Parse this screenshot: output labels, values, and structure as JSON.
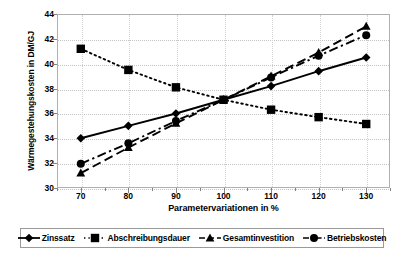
{
  "chart_data": {
    "type": "line",
    "title": "",
    "xlabel": "Parametervariationen in %",
    "ylabel": "Wärmegestehungskosten in DM/GJ",
    "x": [
      70,
      80,
      90,
      100,
      110,
      120,
      130
    ],
    "xlim": [
      65,
      135
    ],
    "ylim": [
      30,
      44
    ],
    "xticks": [
      "70",
      "80",
      "90",
      "100",
      "110",
      "120",
      "130"
    ],
    "yticks": [
      "30",
      "32",
      "34",
      "36",
      "38",
      "40",
      "42",
      "44"
    ],
    "grid": true,
    "legend_position": "bottom",
    "series": [
      {
        "name": "Zinssatz",
        "marker": "diamond",
        "line": "solid",
        "color": "#000000",
        "values": [
          34.0,
          35.0,
          36.0,
          37.1,
          38.2,
          39.4,
          40.5
        ]
      },
      {
        "name": "Abschreibungsdauer",
        "marker": "square",
        "line": "dotted",
        "color": "#000000",
        "values": [
          41.2,
          39.5,
          38.1,
          37.1,
          36.3,
          35.7,
          35.15
        ]
      },
      {
        "name": "Gesamtinvestition",
        "marker": "triangle",
        "line": "dashed",
        "color": "#000000",
        "values": [
          31.2,
          33.25,
          35.2,
          37.1,
          39.0,
          40.9,
          43.0
        ]
      },
      {
        "name": "Betriebskosten",
        "marker": "circle",
        "line": "dash-dot",
        "color": "#000000",
        "values": [
          31.95,
          33.6,
          35.4,
          37.1,
          38.9,
          40.65,
          42.3
        ]
      }
    ]
  },
  "axis": {
    "y_title": "Wärmegestehungskosten in DM/GJ",
    "x_title": "Parametervariationen in %",
    "y_tick_labels": [
      "44",
      "42",
      "40",
      "38",
      "36",
      "34",
      "32",
      "30"
    ],
    "x_tick_labels": [
      "70",
      "80",
      "90",
      "100",
      "110",
      "120",
      "130"
    ]
  },
  "legend": {
    "items": [
      {
        "label": "Zinssatz",
        "marker": "diamond",
        "line": "solid"
      },
      {
        "label": "Abschreibungsdauer",
        "marker": "square",
        "line": "dotted"
      },
      {
        "label": "Gesamtinvestition",
        "marker": "triangle",
        "line": "dashed"
      },
      {
        "label": "Betriebskosten",
        "marker": "circle",
        "line": "dash-dot"
      }
    ]
  }
}
